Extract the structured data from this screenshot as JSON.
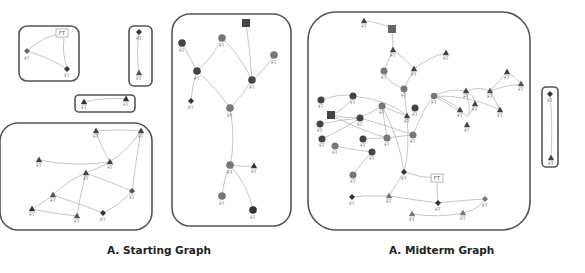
{
  "captions": {
    "left": "A. Starting Graph",
    "right": "A. Midterm Graph"
  },
  "node_label": "FT",
  "colors": {
    "box_stroke": "#555555",
    "edge": "#b8b8b8",
    "node_dark": "#3a3a3a",
    "node_mid": "#6a6a6a",
    "node_light": "#888888"
  },
  "diagram": {
    "panels": [
      {
        "id": "start-cluster-1",
        "graph": "starting",
        "nodes": [
          "box",
          "diamond",
          "diamond"
        ]
      },
      {
        "id": "start-cluster-2",
        "graph": "starting",
        "nodes": [
          "diamond",
          "triangle"
        ]
      },
      {
        "id": "start-cluster-3",
        "graph": "starting",
        "nodes": [
          "triangle",
          "triangle"
        ]
      },
      {
        "id": "start-cluster-4",
        "graph": "starting",
        "nodes": [
          "triangle",
          "triangle",
          "triangle",
          "triangle",
          "triangle",
          "diamond",
          "triangle",
          "triangle",
          "triangle",
          "diamond"
        ]
      },
      {
        "id": "start-cluster-5",
        "graph": "starting",
        "nodes": [
          "square",
          "circle",
          "circle",
          "circle",
          "circle",
          "circle",
          "diamond",
          "circle",
          "circle",
          "triangle",
          "circle",
          "circle"
        ]
      },
      {
        "id": "mid-cluster-1",
        "graph": "midterm",
        "description": "large connected component"
      },
      {
        "id": "mid-cluster-2",
        "graph": "midterm",
        "nodes": [
          "diamond",
          "triangle"
        ]
      }
    ]
  }
}
